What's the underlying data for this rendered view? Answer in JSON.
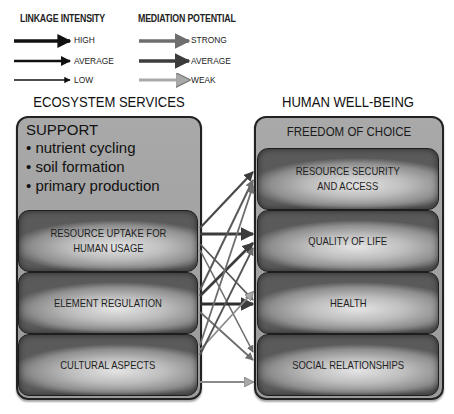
{
  "legend": {
    "linkage": {
      "title": "LINKAGE INTENSITY",
      "items": [
        {
          "label": "HIGH",
          "stroke_width": 3.5,
          "color": "#111111"
        },
        {
          "label": "AVERAGE",
          "stroke_width": 2.5,
          "color": "#111111"
        },
        {
          "label": "LOW",
          "stroke_width": 1.6,
          "color": "#111111"
        }
      ]
    },
    "mediation": {
      "title": "MEDIATION POTENTIAL",
      "items": [
        {
          "label": "STRONG",
          "color": "#6e6e6e"
        },
        {
          "label": "AVERAGE",
          "color": "#3c3c3c"
        },
        {
          "label": "WEAK",
          "color": "#a9a9a9"
        }
      ]
    }
  },
  "left_column": {
    "title": "ECOSYSTEM SERVICES",
    "support": {
      "title": "SUPPORT",
      "items": [
        "• nutrient cycling",
        "• soil formation",
        "• primary production"
      ]
    },
    "boxes": [
      {
        "label_line1": "RESOURCE UPTAKE FOR",
        "label_line2": "HUMAN USAGE"
      },
      {
        "label_line1": "ELEMENT REGULATION",
        "label_line2": ""
      },
      {
        "label_line1": "CULTURAL ASPECTS",
        "label_line2": ""
      }
    ]
  },
  "right_column": {
    "title": "HUMAN WELL-BEING",
    "header": "FREEDOM OF CHOICE",
    "boxes": [
      {
        "label_line1": "RESOURCE SECURITY",
        "label_line2": "AND ACCESS"
      },
      {
        "label_line1": "QUALITY OF LIFE",
        "label_line2": ""
      },
      {
        "label_line1": "HEALTH",
        "label_line2": ""
      },
      {
        "label_line1": "SOCIAL RELATIONSHIPS",
        "label_line2": ""
      }
    ]
  },
  "links": [
    {
      "from": "RESOURCE UPTAKE FOR HUMAN USAGE",
      "to": "RESOURCE SECURITY AND ACCESS"
    },
    {
      "from": "RESOURCE UPTAKE FOR HUMAN USAGE",
      "to": "QUALITY OF LIFE"
    },
    {
      "from": "RESOURCE UPTAKE FOR HUMAN USAGE",
      "to": "HEALTH"
    },
    {
      "from": "RESOURCE UPTAKE FOR HUMAN USAGE",
      "to": "SOCIAL RELATIONSHIPS"
    },
    {
      "from": "ELEMENT REGULATION",
      "to": "RESOURCE SECURITY AND ACCESS"
    },
    {
      "from": "ELEMENT REGULATION",
      "to": "QUALITY OF LIFE"
    },
    {
      "from": "ELEMENT REGULATION",
      "to": "HEALTH"
    },
    {
      "from": "ELEMENT REGULATION",
      "to": "SOCIAL RELATIONSHIPS"
    },
    {
      "from": "CULTURAL ASPECTS",
      "to": "RESOURCE SECURITY AND ACCESS"
    },
    {
      "from": "CULTURAL ASPECTS",
      "to": "QUALITY OF LIFE"
    },
    {
      "from": "CULTURAL ASPECTS",
      "to": "HEALTH"
    },
    {
      "from": "CULTURAL ASPECTS",
      "to": "SOCIAL RELATIONSHIPS"
    }
  ]
}
